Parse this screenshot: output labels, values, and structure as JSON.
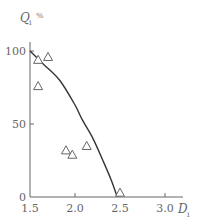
{
  "chart_data": {
    "type": "scatter",
    "title": "",
    "xlabel": "D",
    "xlabel_subscript": "i",
    "ylabel": "Q",
    "ylabel_subscript": "i",
    "ylabel_unit": "%",
    "xlim": [
      1.5,
      3.1
    ],
    "ylim": [
      0,
      100
    ],
    "x_ticks": [
      1.5,
      2.0,
      2.5,
      3.0
    ],
    "x_tick_labels": [
      "1.5",
      "2.0",
      "2.5",
      "3.0"
    ],
    "y_ticks": [
      0,
      50,
      100
    ],
    "y_tick_labels": [
      "0",
      "50",
      "100"
    ],
    "grid": false,
    "legend": null,
    "series": [
      {
        "name": "observed",
        "type": "scatter",
        "marker": "triangle-open",
        "x": [
          1.59,
          1.7,
          1.59,
          1.9,
          1.97,
          2.13,
          2.5
        ],
        "y": [
          94,
          96,
          76,
          32,
          29,
          35,
          3
        ]
      },
      {
        "name": "fitted curve",
        "type": "line",
        "x": [
          1.5,
          1.65,
          1.83,
          2.0,
          2.08,
          2.2,
          2.31,
          2.4,
          2.47
        ],
        "y": [
          100,
          91,
          80,
          63,
          53,
          40,
          25,
          12,
          0
        ]
      }
    ]
  },
  "colors": {
    "axis": "#666666",
    "curve": "#333333",
    "marker": "#666666"
  }
}
